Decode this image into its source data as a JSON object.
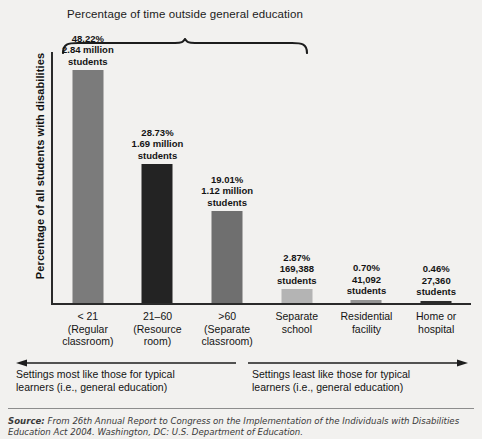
{
  "figure": {
    "bracket_title_line1": "Percentage of time",
    "bracket_title_line2": "outside general education",
    "y_axis_label": "Percentage of all students with disabilities",
    "note_left_line1": "Settings most like those for typical",
    "note_left_line2": "learners (i.e., general education)",
    "note_right_line1": "Settings least like those for typical",
    "note_right_line2": "learners (i.e., general education)",
    "source_lead": "Source:",
    "source_line1": " From 26th Annual Report to Congress on the Implementation of the Individuals with Disabilities",
    "source_line2": "Education Act 2004. Washington, DC: U.S. Department of Education."
  },
  "chart_data": {
    "type": "bar",
    "title": "Percentage of time outside general education",
    "xlabel": "",
    "ylabel": "Percentage of all students with disabilities",
    "ylim": [
      0,
      52
    ],
    "grid": false,
    "legend": "none",
    "categories": [
      "< 21 (Regular classroom)",
      "21–60 (Resource room)",
      ">60 (Separate classroom)",
      "Separate school",
      "Residential facility",
      "Home or hospital"
    ],
    "values": [
      48.22,
      28.73,
      19.01,
      2.87,
      0.7,
      0.46
    ],
    "bars": [
      {
        "category_line1": "< 21",
        "category_line2": "(Regular",
        "category_line3": "classroom)",
        "percent": "48.22%",
        "count_line1": "2.84 million",
        "count_line2": "students",
        "value": 48.22,
        "students": 2840000,
        "color": "#7b7b7b"
      },
      {
        "category_line1": "21–60",
        "category_line2": "(Resource",
        "category_line3": "room)",
        "percent": "28.73%",
        "count_line1": "1.69 million",
        "count_line2": "students",
        "value": 28.73,
        "students": 1690000,
        "color": "#232323"
      },
      {
        "category_line1": ">60",
        "category_line2": "(Separate",
        "category_line3": "classroom)",
        "percent": "19.01%",
        "count_line1": "1.12 million",
        "count_line2": "students",
        "value": 19.01,
        "students": 1120000,
        "color": "#6f6f6f"
      },
      {
        "category_line1": "Separate",
        "category_line2": "school",
        "category_line3": "",
        "percent": "2.87%",
        "count_line1": "169,388",
        "count_line2": "students",
        "value": 2.87,
        "students": 169388,
        "color": "#b4b4b4"
      },
      {
        "category_line1": "Residential",
        "category_line2": "facility",
        "category_line3": "",
        "percent": "0.70%",
        "count_line1": "41,092",
        "count_line2": "students",
        "value": 0.7,
        "students": 41092,
        "color": "#949494"
      },
      {
        "category_line1": "Home or",
        "category_line2": "hospital",
        "category_line3": "",
        "percent": "0.46%",
        "count_line1": "27,360",
        "count_line2": "students",
        "value": 0.46,
        "students": 27360,
        "color": "#2b2b2b"
      }
    ]
  }
}
